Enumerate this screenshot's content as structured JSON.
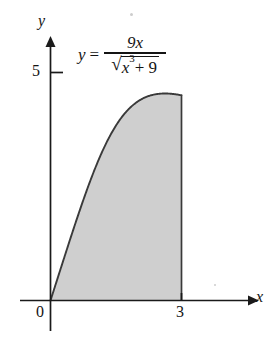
{
  "figure": {
    "type": "math-figure",
    "background_color": "#ffffff",
    "curve_color": "#3a3a3a",
    "fill_color": "#cfcfcf",
    "axis_color": "#1a1a1a"
  },
  "equation": {
    "lhs": "y",
    "relation": "=",
    "numerator": "9x",
    "denominator_radicand": "x",
    "denominator_exponent": "3",
    "denominator_tail": "+ 9",
    "plain": "y = 9x / sqrt(x^3 + 9)"
  },
  "axes": {
    "x_label": "x",
    "y_label": "y",
    "origin_label": "0",
    "x_ticks": [
      {
        "value": 3,
        "label": "3"
      }
    ],
    "y_ticks": [
      {
        "value": 5,
        "label": "5"
      }
    ]
  },
  "chart_data": {
    "type": "area",
    "title": "",
    "subtitle": "",
    "xlabel": "x",
    "ylabel": "y",
    "xlim": [
      0,
      4.6
    ],
    "ylim": [
      0,
      5.75
    ],
    "grid": false,
    "legend": null,
    "annotations": [
      {
        "text": "y = 9x / sqrt(x^3 + 9)",
        "x": 0.65,
        "y": 5.3
      }
    ],
    "shaded_region": {
      "label": "area under curve",
      "x_from": 0,
      "x_to": 3,
      "fill": "#cfcfcf",
      "bounded_above_by": "y = 9x / sqrt(x^3 + 9)",
      "bounded_below_by": "y = 0"
    },
    "series": [
      {
        "name": "y = 9x / sqrt(x^3 + 9)",
        "x": [
          0,
          0.15,
          0.3,
          0.45,
          0.6,
          0.75,
          0.9,
          1.05,
          1.2,
          1.35,
          1.5,
          1.65,
          1.8,
          1.95,
          2.1,
          2.25,
          2.4,
          2.55,
          2.7,
          2.85,
          3
        ],
        "values": [
          0,
          0.45,
          0.9,
          1.34,
          1.78,
          2.21,
          2.62,
          3.0,
          3.35,
          3.66,
          3.92,
          4.13,
          4.29,
          4.4,
          4.46,
          4.48,
          4.47,
          4.42,
          4.35,
          4.26,
          4.16
        ]
      }
    ]
  }
}
